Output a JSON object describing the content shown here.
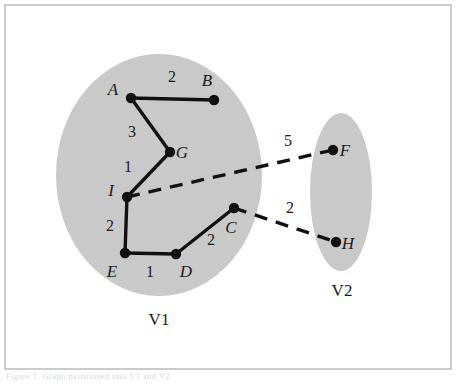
{
  "figure": {
    "frame": {
      "border_color": "#b5b5b5",
      "background": "#ffffff",
      "x": 5,
      "y": 5,
      "width": 446,
      "height": 364
    },
    "caption_fragment": "Figure 1.  Graph partitioned into V1 and V2"
  },
  "style": {
    "cluster_fill": "#c9c9c9",
    "node_fill": "#111111",
    "edge_color": "#111111",
    "solid_edge_width": 3.4,
    "dashed_edge_width": 3.4,
    "node_radius": 5.2
  },
  "chart_data": {
    "type": "diagram",
    "clusters": [
      {
        "id": "V1",
        "label": "V1",
        "label_x": 159,
        "label_y": 325,
        "shape": "ellipse",
        "cx": 159,
        "cy": 175,
        "rx": 103,
        "ry": 121,
        "members": [
          "A",
          "B",
          "G",
          "I",
          "E",
          "D",
          "C"
        ]
      },
      {
        "id": "V2",
        "label": "V2",
        "label_x": 342,
        "label_y": 296,
        "shape": "ellipse",
        "cx": 341,
        "cy": 192,
        "rx": 31,
        "ry": 79,
        "members": [
          "F",
          "H"
        ]
      }
    ],
    "nodes": [
      {
        "id": "A",
        "label": "A",
        "x": 131,
        "y": 98,
        "label_x": 113,
        "label_y": 95,
        "cluster": "V1"
      },
      {
        "id": "B",
        "label": "B",
        "x": 214,
        "y": 100,
        "label_x": 207,
        "label_y": 86,
        "cluster": "V1"
      },
      {
        "id": "G",
        "label": "G",
        "x": 170,
        "y": 152,
        "label_x": 182,
        "label_y": 158,
        "cluster": "V1"
      },
      {
        "id": "I",
        "label": "I",
        "x": 127,
        "y": 197,
        "label_x": 111,
        "label_y": 196,
        "cluster": "V1"
      },
      {
        "id": "E",
        "label": "E",
        "x": 125,
        "y": 253,
        "label_x": 112,
        "label_y": 277,
        "cluster": "V1"
      },
      {
        "id": "D",
        "label": "D",
        "x": 176,
        "y": 254,
        "label_x": 186,
        "label_y": 277,
        "cluster": "V1"
      },
      {
        "id": "C",
        "label": "C",
        "x": 234,
        "y": 208,
        "label_x": 231,
        "label_y": 233,
        "cluster": "V1"
      },
      {
        "id": "F",
        "label": "F",
        "x": 333,
        "y": 150,
        "label_x": 345,
        "label_y": 156,
        "cluster": "V2"
      },
      {
        "id": "H",
        "label": "H",
        "x": 336,
        "y": 242,
        "label_x": 348,
        "label_y": 249,
        "cluster": "V2"
      }
    ],
    "edges": [
      {
        "source": "A",
        "target": "B",
        "weight": "2",
        "style": "solid",
        "label_x": 172,
        "label_y": 82
      },
      {
        "source": "A",
        "target": "G",
        "weight": "3",
        "style": "solid",
        "label_x": 132,
        "label_y": 137
      },
      {
        "source": "G",
        "target": "I",
        "weight": "1",
        "style": "solid",
        "label_x": 128,
        "label_y": 172
      },
      {
        "source": "I",
        "target": "E",
        "weight": "2",
        "style": "solid",
        "label_x": 110,
        "label_y": 231
      },
      {
        "source": "E",
        "target": "D",
        "weight": "1",
        "style": "solid",
        "label_x": 150,
        "label_y": 277
      },
      {
        "source": "D",
        "target": "C",
        "weight": "2",
        "style": "solid",
        "label_x": 211,
        "label_y": 245
      },
      {
        "source": "I",
        "target": "F",
        "weight": "5",
        "style": "dashed",
        "label_x": 288,
        "label_y": 146
      },
      {
        "source": "C",
        "target": "H",
        "weight": "2",
        "style": "dashed",
        "label_x": 290,
        "label_y": 213
      }
    ]
  }
}
